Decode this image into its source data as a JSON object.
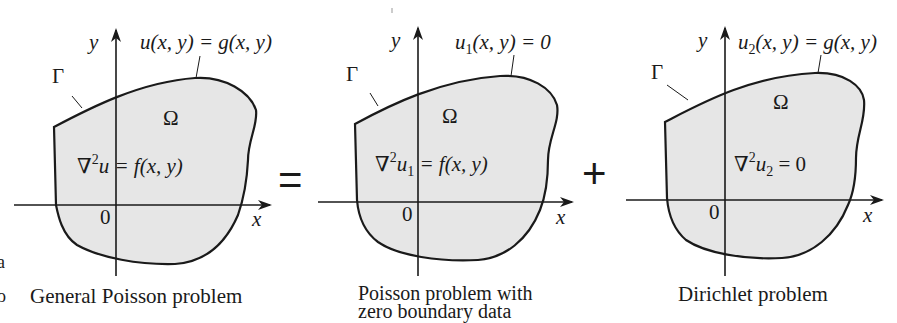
{
  "figure": {
    "operator_equals": "=",
    "operator_plus": "+",
    "margin_fragments": [
      "a",
      "o"
    ],
    "colors": {
      "region_fill": "#e6e6e6",
      "stroke": "#1a1a1a",
      "background": "#ffffff"
    },
    "panels": [
      {
        "id": "general",
        "axis_y": "y",
        "axis_x": "x",
        "origin": "0",
        "boundary_name": "Γ",
        "domain_name": "Ω",
        "boundary_condition": {
          "lhs": "u",
          "lhs_sub": "",
          "rhs": "(x, y) = g(x, y)"
        },
        "pde": {
          "nabla": "∇",
          "power": "2",
          "var": "u",
          "var_sub": "",
          "rhs": " = f(x, y)"
        },
        "caption": "General Poisson problem"
      },
      {
        "id": "poisson-zero-boundary",
        "axis_y": "y",
        "axis_x": "x",
        "origin": "0",
        "boundary_name": "Γ",
        "domain_name": "Ω",
        "boundary_condition": {
          "lhs": "u",
          "lhs_sub": "1",
          "rhs": "(x, y) = 0"
        },
        "pde": {
          "nabla": "∇",
          "power": "2",
          "var": "u",
          "var_sub": "1",
          "rhs": " = f(x, y)"
        },
        "caption_line1": "Poisson problem with",
        "caption_line2": "zero boundary data"
      },
      {
        "id": "dirichlet",
        "axis_y": "y",
        "axis_x": "x",
        "origin": "0",
        "boundary_name": "Γ",
        "domain_name": "Ω",
        "boundary_condition": {
          "lhs": "u",
          "lhs_sub": "2",
          "rhs": "(x, y) = g(x, y)"
        },
        "pde": {
          "nabla": "∇",
          "power": "2",
          "var": "u",
          "var_sub": "2",
          "rhs": " = 0"
        },
        "caption": "Dirichlet problem"
      }
    ]
  }
}
